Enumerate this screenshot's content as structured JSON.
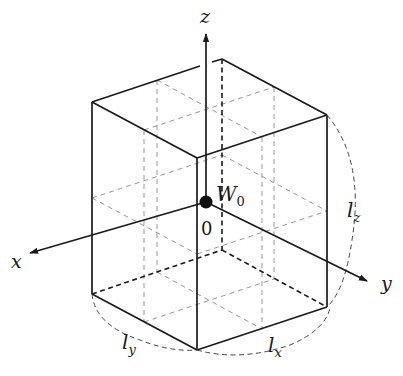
{
  "diagram": {
    "type": "3d-box-coordinate-system",
    "axes": {
      "x": {
        "label": "x"
      },
      "y": {
        "label": "y"
      },
      "z": {
        "label": "z"
      }
    },
    "origin": {
      "label": "0",
      "point_label": "W",
      "point_subscript": "0"
    },
    "dimensions": {
      "lx": {
        "base": "l",
        "sub": "x"
      },
      "ly": {
        "base": "l",
        "sub": "y"
      },
      "lz": {
        "base": "l",
        "sub": "z"
      }
    },
    "colors": {
      "line": "#1a1a1a",
      "dashed_light": "#8a8a8a",
      "background": "#ffffff"
    }
  }
}
